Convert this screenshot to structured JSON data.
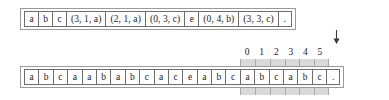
{
  "figure": {
    "top_row": {
      "name": "output-tape",
      "cells": [
        {
          "text": "a",
          "kind": "sym"
        },
        {
          "text": "b",
          "kind": "sym"
        },
        {
          "text": "c",
          "kind": "sym"
        },
        {
          "text": "(3, 1, a)",
          "kind": "tuple"
        },
        {
          "text": "(2, 1, a)",
          "kind": "tuple"
        },
        {
          "text": "(0, 3, c)",
          "kind": "tuple"
        },
        {
          "text": "e",
          "kind": "sym"
        },
        {
          "text": "(0, 4, b)",
          "kind": "tuple"
        },
        {
          "text": "(3, 3, c)",
          "kind": "tuple"
        },
        {
          "text": ".",
          "kind": "dot"
        }
      ]
    },
    "bottom_row": {
      "name": "input-tape",
      "cells": [
        {
          "text": "a",
          "kind": "sym",
          "highlighted": false
        },
        {
          "text": "b",
          "kind": "sym",
          "highlighted": false
        },
        {
          "text": "c",
          "kind": "sym",
          "highlighted": false
        },
        {
          "text": "a",
          "kind": "sym",
          "highlighted": false
        },
        {
          "text": "a",
          "kind": "sym",
          "highlighted": false
        },
        {
          "text": "b",
          "kind": "sym",
          "highlighted": false
        },
        {
          "text": "a",
          "kind": "sym",
          "highlighted": false
        },
        {
          "text": "b",
          "kind": "sym",
          "highlighted": false
        },
        {
          "text": "c",
          "kind": "sym",
          "highlighted": false
        },
        {
          "text": "a",
          "kind": "sym",
          "highlighted": false
        },
        {
          "text": "c",
          "kind": "sym",
          "highlighted": false
        },
        {
          "text": "e",
          "kind": "sym",
          "highlighted": false
        },
        {
          "text": "a",
          "kind": "sym",
          "highlighted": false
        },
        {
          "text": "b",
          "kind": "sym",
          "highlighted": false
        },
        {
          "text": "c",
          "kind": "sym",
          "highlighted": false
        },
        {
          "text": "a",
          "kind": "sym",
          "highlighted": true
        },
        {
          "text": "b",
          "kind": "sym",
          "highlighted": true
        },
        {
          "text": "c",
          "kind": "sym",
          "highlighted": true
        },
        {
          "text": "a",
          "kind": "sym",
          "highlighted": true
        },
        {
          "text": "b",
          "kind": "sym",
          "highlighted": true
        },
        {
          "text": "c",
          "kind": "sym",
          "highlighted": true
        },
        {
          "text": ".",
          "kind": "dot",
          "highlighted": false
        }
      ]
    },
    "index_ruler": {
      "labels": [
        "0",
        "1",
        "2",
        "3",
        "4",
        "5"
      ]
    },
    "pointer": {
      "name": "lookahead-pointer",
      "direction": "down"
    },
    "colors": {
      "highlight": "#d9d9d9",
      "cell_border": "#6e6e6e",
      "rail_border": "#9a9a9a",
      "text": "#1a1a1a",
      "background": "#ffffff"
    }
  }
}
